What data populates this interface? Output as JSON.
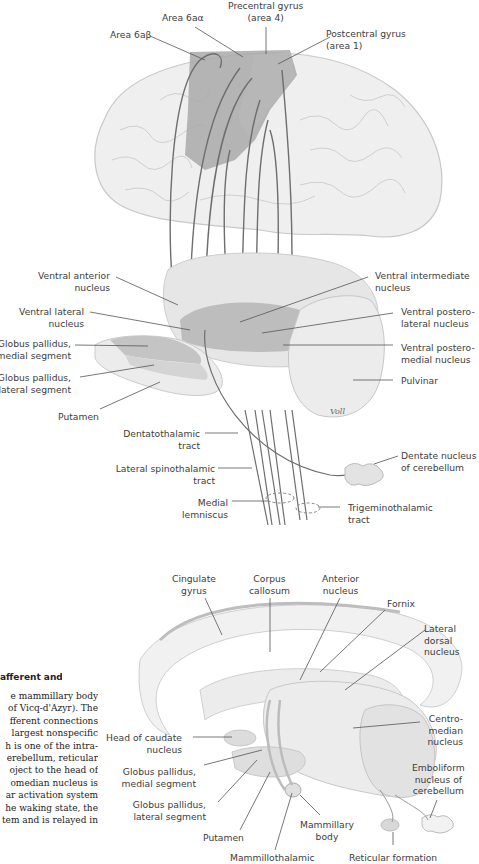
{
  "figure_top": {
    "title": "Thalamic connections to cortex (lateral view)",
    "labels": {
      "precentral_gyrus": [
        "Precentral gyrus",
        "(area 4)"
      ],
      "area_6a_alpha": [
        "Area 6aα"
      ],
      "area_6a_beta": [
        "Area 6aβ"
      ],
      "postcentral_gyrus": [
        "Postcentral gyrus",
        "(area 1)"
      ],
      "ventral_anterior_nucleus": [
        "Ventral anterior",
        "nucleus"
      ],
      "ventral_lateral_nucleus": [
        "Ventral lateral",
        "nucleus"
      ],
      "globus_pallidus_medial": [
        "Globus pallidus,",
        "medial segment"
      ],
      "globus_pallidus_lateral": [
        "Globus pallidus,",
        "lateral segment"
      ],
      "putamen": [
        "Putamen"
      ],
      "ventral_intermediate_nucleus": [
        "Ventral intermediate",
        "nucleus"
      ],
      "ventral_posterolateral_nucleus": [
        "Ventral postero-",
        "lateral nucleus"
      ],
      "ventral_posteromedial_nucleus": [
        "Ventral postero-",
        "medial nucleus"
      ],
      "pulvinar": [
        "Pulvinar"
      ],
      "dentatothalamic_tract": [
        "Dentatothalamic",
        "tract"
      ],
      "dentate_nucleus": [
        "Dentate nucleus",
        "of cerebellum"
      ],
      "lateral_spinothalamic_tract": [
        "Lateral spinothalamic",
        "tract"
      ],
      "medial_lemniscus": [
        "Medial",
        "lemniscus"
      ],
      "trigeminothalamic_tract": [
        "Trigeminothalamic",
        "tract"
      ]
    },
    "signature": "Voll"
  },
  "figure_bottom": {
    "labels": {
      "cingulate_gyrus": [
        "Cingulate",
        "gyrus"
      ],
      "corpus_callosum": [
        "Corpus",
        "callosum"
      ],
      "anterior_nucleus": [
        "Anterior",
        "nucleus"
      ],
      "fornix": [
        "Fornix"
      ],
      "lateral_dorsal_nucleus": [
        "Lateral",
        "dorsal",
        "nucleus"
      ],
      "head_of_caudate": [
        "Head of caudate",
        "nucleus"
      ],
      "globus_pallidus_medial": [
        "Globus pallidus,",
        "medial segment"
      ],
      "globus_pallidus_lateral": [
        "Globus pallidus,",
        "lateral segment"
      ],
      "putamen": [
        "Putamen"
      ],
      "mammillary_body": [
        "Mammillary",
        "body"
      ],
      "mammillothalamic": [
        "Mammillothalamic"
      ],
      "reticular_formation": [
        "Reticular formation"
      ],
      "centromedian_nucleus": [
        "Centro-",
        "median",
        "nucleus"
      ],
      "emboliform_nucleus": [
        "Emboliform",
        "nucleus of",
        "cerebellum"
      ]
    }
  },
  "text_column": {
    "heading": "afferent and",
    "lines": [
      "e mammillary body",
      "of Vicq-d'Azyr). The",
      "fferent connections",
      "largest nonspecific",
      "h is one of the intra-",
      "erebellum, reticular",
      "oject to the head of",
      "omedian nucleus is",
      "ar activation system",
      "he waking state, the",
      "tem and is relayed in"
    ]
  },
  "colors": {
    "brain_fill": "#efefef",
    "brain_outline": "#c8c8c8",
    "cortex_highlight": "#a9a9a9",
    "cortex_highlight_light": "#bdbdbd",
    "thalamus_fill": "#e6e6e6",
    "thalamus_dark": "#b4b4b4",
    "fiber": "#6e6e6e",
    "leader_line": "#555555",
    "text": "#3d3d3d"
  }
}
